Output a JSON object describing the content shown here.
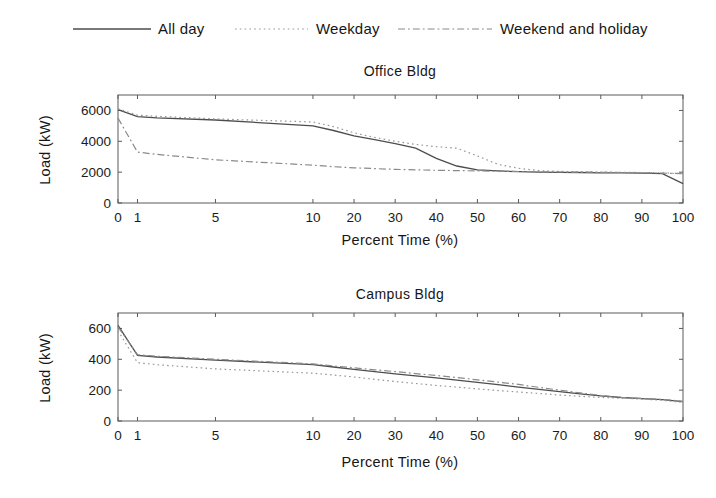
{
  "figure": {
    "background": "#ffffff",
    "frame_color": "#5a5a5a",
    "text_color": "#1b1b1b",
    "series_colors": {
      "solid": "#4d4d4d",
      "dotted": "#979797",
      "dashdot": "#8a8a8a"
    }
  },
  "legend": {
    "position": "top",
    "items": [
      {
        "label": "All day",
        "style": "solid"
      },
      {
        "label": "Weekday",
        "style": "dotted"
      },
      {
        "label": "Weekend and holiday",
        "style": "dashdot"
      }
    ]
  },
  "chart_data": [
    {
      "type": "line",
      "title": "Office Bldg",
      "xlabel": "Percent Time (%)",
      "ylabel": "Load (kW)",
      "x_ticks": [
        0,
        1,
        5,
        10,
        20,
        30,
        40,
        50,
        60,
        70,
        80,
        90,
        100
      ],
      "y_ticks": [
        0,
        2000,
        4000,
        6000
      ],
      "ylim": [
        0,
        7000
      ],
      "xlim": [
        0,
        100
      ],
      "grid": false,
      "x_scale": {
        "type": "piecewise-linear",
        "breakpoint": 10,
        "breakpoint_fraction": 0.345
      },
      "x": [
        0,
        1,
        2,
        5,
        10,
        15,
        20,
        25,
        30,
        35,
        40,
        45,
        50,
        55,
        60,
        65,
        70,
        75,
        80,
        85,
        90,
        95,
        100
      ],
      "series": [
        {
          "name": "All day",
          "style": "solid",
          "values": [
            6050,
            5600,
            5520,
            5380,
            5000,
            4700,
            4350,
            4100,
            3850,
            3550,
            2900,
            2400,
            2150,
            2080,
            2030,
            2000,
            1990,
            1975,
            1960,
            1950,
            1940,
            1900,
            1250
          ]
        },
        {
          "name": "Weekday",
          "style": "dotted",
          "values": [
            6100,
            5700,
            5620,
            5450,
            5250,
            4950,
            4550,
            4250,
            4000,
            3800,
            3650,
            3550,
            3050,
            2500,
            2250,
            2100,
            2050,
            2020,
            2000,
            1990,
            1980,
            1960,
            1900
          ]
        },
        {
          "name": "Weekend and holiday",
          "style": "dashdot",
          "values": [
            5500,
            3300,
            3150,
            2800,
            2450,
            2350,
            2280,
            2230,
            2180,
            2150,
            2120,
            2100,
            2080,
            2060,
            2040,
            2020,
            2010,
            2000,
            1990,
            1975,
            1960,
            1940,
            1900
          ]
        }
      ]
    },
    {
      "type": "line",
      "title": "Campus Bldg",
      "xlabel": "Percent Time (%)",
      "ylabel": "Load (kW)",
      "x_ticks": [
        0,
        1,
        5,
        10,
        20,
        30,
        40,
        50,
        60,
        70,
        80,
        90,
        100
      ],
      "y_ticks": [
        0,
        200,
        400,
        600
      ],
      "ylim": [
        0,
        700
      ],
      "xlim": [
        0,
        100
      ],
      "grid": false,
      "x_scale": {
        "type": "piecewise-linear",
        "breakpoint": 10,
        "breakpoint_fraction": 0.345
      },
      "x": [
        0,
        1,
        2,
        5,
        10,
        15,
        20,
        25,
        30,
        35,
        40,
        45,
        50,
        55,
        60,
        65,
        70,
        75,
        80,
        85,
        90,
        95,
        100
      ],
      "series": [
        {
          "name": "All day",
          "style": "solid",
          "values": [
            620,
            425,
            415,
            395,
            365,
            350,
            335,
            320,
            305,
            293,
            280,
            265,
            250,
            235,
            220,
            205,
            190,
            176,
            163,
            152,
            145,
            138,
            125
          ]
        },
        {
          "name": "Weekday",
          "style": "dotted",
          "values": [
            585,
            378,
            365,
            338,
            310,
            298,
            285,
            270,
            256,
            243,
            230,
            220,
            208,
            198,
            188,
            178,
            168,
            160,
            153,
            148,
            142,
            134,
            120
          ]
        },
        {
          "name": "Weekend and holiday",
          "style": "dashdot",
          "values": [
            610,
            430,
            420,
            400,
            370,
            357,
            345,
            332,
            320,
            307,
            295,
            281,
            267,
            252,
            237,
            218,
            200,
            182,
            165,
            153,
            146,
            140,
            128
          ]
        }
      ]
    }
  ]
}
